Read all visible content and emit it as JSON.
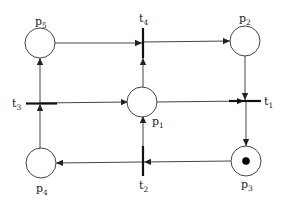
{
  "diagram": {
    "type": "petri-net",
    "colors": {
      "stroke": "#333333",
      "background": "#ffffff",
      "token": "#000000"
    },
    "places": [
      {
        "id": "p1",
        "label": "p",
        "sub": "1",
        "tokens": 0
      },
      {
        "id": "p2",
        "label": "p",
        "sub": "2",
        "tokens": 0
      },
      {
        "id": "p3",
        "label": "p",
        "sub": "3",
        "tokens": 1
      },
      {
        "id": "p4",
        "label": "p",
        "sub": "4",
        "tokens": 0
      },
      {
        "id": "p5",
        "label": "p",
        "sub": "5",
        "tokens": 0
      }
    ],
    "transitions": [
      {
        "id": "t1",
        "label": "t",
        "sub": "1"
      },
      {
        "id": "t2",
        "label": "t",
        "sub": "2"
      },
      {
        "id": "t3",
        "label": "t",
        "sub": "3"
      },
      {
        "id": "t4",
        "label": "t",
        "sub": "4"
      }
    ],
    "arcs": [
      {
        "from": "p5",
        "to": "t4"
      },
      {
        "from": "t4",
        "to": "p2"
      },
      {
        "from": "p1",
        "to": "t4"
      },
      {
        "from": "p2",
        "to": "t1"
      },
      {
        "from": "p1",
        "to": "t1"
      },
      {
        "from": "t1",
        "to": "p3"
      },
      {
        "from": "p3",
        "to": "t2"
      },
      {
        "from": "t2",
        "to": "p4"
      },
      {
        "from": "t2",
        "to": "p1"
      },
      {
        "from": "p4",
        "to": "t3"
      },
      {
        "from": "t3",
        "to": "p5"
      },
      {
        "from": "t3",
        "to": "p1"
      }
    ]
  }
}
